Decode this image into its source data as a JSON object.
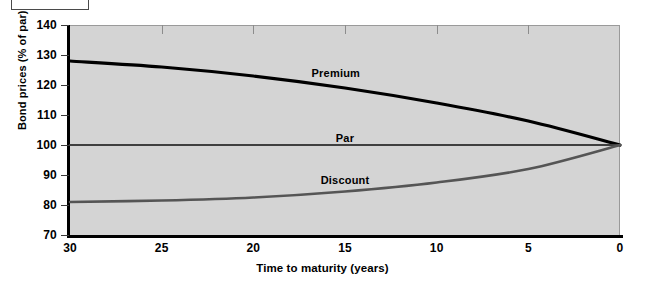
{
  "figure_box": {
    "label": ""
  },
  "chart_data": {
    "type": "line",
    "title": "",
    "xlabel": "Time to maturity (years)",
    "ylabel": "Bond prices (% of par)",
    "xlim": [
      30,
      0
    ],
    "ylim": [
      70,
      140
    ],
    "x_reversed": true,
    "grid": false,
    "legend": "in-plot-annotations",
    "x_ticks": [
      30,
      25,
      20,
      15,
      10,
      5,
      0
    ],
    "y_ticks": [
      70,
      80,
      90,
      100,
      110,
      120,
      130,
      140
    ],
    "x": [
      30,
      25,
      20,
      15,
      10,
      5,
      0
    ],
    "series": [
      {
        "name": "Premium",
        "color": "#000000",
        "values": [
          128,
          126,
          123,
          119,
          114,
          108,
          100
        ],
        "label_x": 15.5,
        "label_y": 126
      },
      {
        "name": "Par",
        "color": "#3f3f3f",
        "values": [
          100,
          100,
          100,
          100,
          100,
          100,
          100
        ],
        "label_x": 15.0,
        "label_y": 104.5
      },
      {
        "name": "Discount",
        "color": "#555555",
        "values": [
          81,
          81.5,
          82.5,
          84.5,
          87.5,
          92,
          100
        ],
        "label_x": 15.0,
        "label_y": 90.5
      }
    ]
  }
}
